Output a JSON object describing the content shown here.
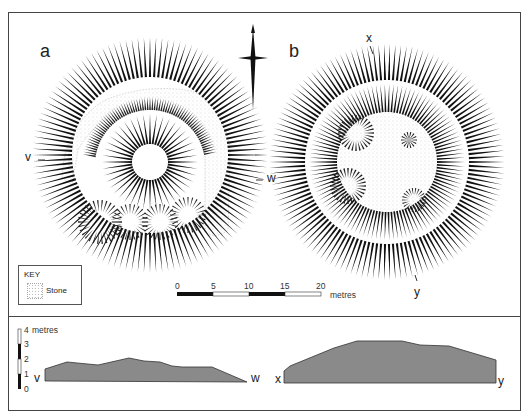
{
  "figure": {
    "plan_a": {
      "label": "a",
      "section_start": "v",
      "section_end": "w"
    },
    "plan_b": {
      "label": "b",
      "section_start": "x",
      "section_end": "y"
    },
    "north_arrow": {
      "icon": "north-arrow-icon"
    },
    "key": {
      "title": "KEY",
      "items": [
        {
          "label": "Stone",
          "icon": "stone-stipple-icon"
        }
      ]
    },
    "scale_bar": {
      "ticks": [
        "0",
        "5",
        "10",
        "15",
        "20"
      ],
      "unit": "metres"
    },
    "vertical_scale": {
      "ticks": [
        "0",
        "1",
        "2",
        "3",
        "4"
      ],
      "unit": "metres"
    },
    "sections": [
      {
        "start": "v",
        "end": "w"
      },
      {
        "start": "x",
        "end": "y"
      }
    ]
  },
  "colors": {
    "frame": "#444444",
    "hachure": "#111111",
    "section_fill": "#8a8a8a",
    "stipple": "#b8b8b8"
  }
}
